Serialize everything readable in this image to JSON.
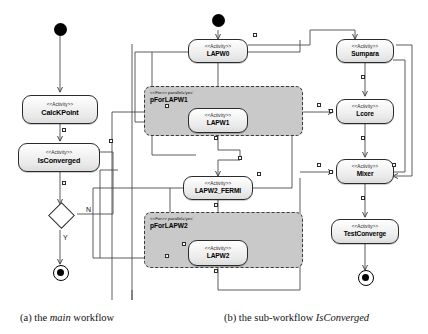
{
  "figure": {
    "background": "#ffffff",
    "line_color": "#4a4a4a",
    "node_fill": "#e9e9e9",
    "partition_fill": "#c9c9c9"
  },
  "captions": {
    "a_prefix": "(a) the ",
    "a_italic": "main",
    "a_suffix": " workflow",
    "b_prefix": "(b) the sub-workflow ",
    "b_italic": "IsConverged",
    "b_suffix": ""
  },
  "stereotypes": {
    "activity": "<<Activity>>",
    "for": "<<For>> parallel='yes'"
  },
  "main_workflow": {
    "name": "main",
    "initial": "initial-node",
    "final": "final-node",
    "nodes": [
      {
        "id": "calckpoint",
        "stereotype": "<<Activity>>",
        "name": "CalcKPoint"
      },
      {
        "id": "isconverged",
        "stereotype": "<<Activity>>",
        "name": "IsConverged"
      }
    ],
    "decision": {
      "id": "decision",
      "guard_yes": "Y",
      "guard_no": "N"
    }
  },
  "sub_workflow": {
    "name": "IsConverged",
    "initial": "initial-node",
    "final": "final-node",
    "nodes": [
      {
        "id": "lapw0",
        "stereotype": "<<Activity>>",
        "name": "LAPW0"
      },
      {
        "id": "lapw1",
        "stereotype": "<<Activity>>",
        "name": "LAPW1"
      },
      {
        "id": "lapw2_fermi",
        "stereotype": "<<Activity>>",
        "name": "LAPW2_FERMI"
      },
      {
        "id": "lapw2",
        "stereotype": "<<Activity>>",
        "name": "LAPW2"
      },
      {
        "id": "sumpara",
        "stereotype": "<<Activity>>",
        "name": "Sumpara"
      },
      {
        "id": "lcore",
        "stereotype": "<<Activity>>",
        "name": "Lcore"
      },
      {
        "id": "mixer",
        "stereotype": "<<Activity>>",
        "name": "Mixer"
      },
      {
        "id": "testconverge",
        "stereotype": "<<Activity>>",
        "name": "TestConverge"
      }
    ],
    "partitions": [
      {
        "id": "pforlapw1",
        "stereotype": "<<For>> parallel='yes'",
        "name": "pForLAPW1"
      },
      {
        "id": "pforlapw2",
        "stereotype": "<<For>> parallel='yes'",
        "name": "pForLAPW2"
      }
    ]
  }
}
